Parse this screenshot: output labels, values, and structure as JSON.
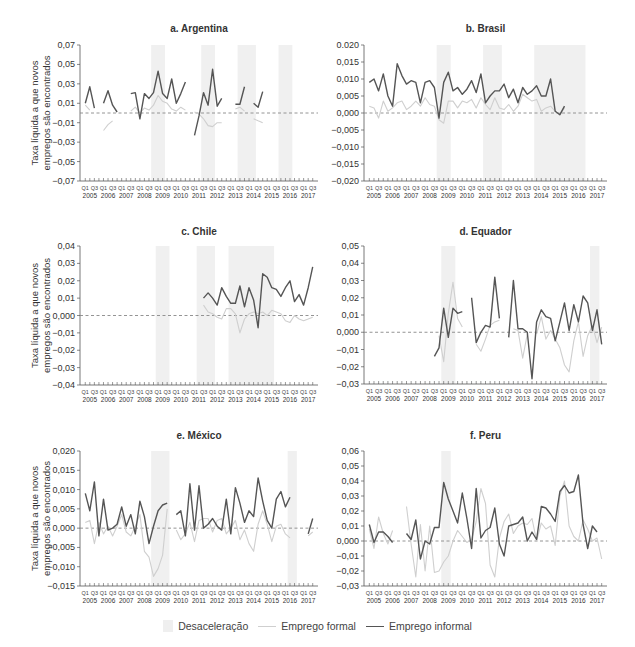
{
  "figure": {
    "legend": {
      "recession_label": "Desaceleração",
      "formal_label": "Emprego formal",
      "informal_label": "Emprego informal"
    },
    "ylabel_line1": "Taxa líquida a que novos",
    "ylabel_line2": "empregos são encontrados"
  },
  "colors": {
    "informal": "#555555",
    "formal": "#cfcfcf",
    "recession_band": "#f0f0f0",
    "zero_line": "#888888",
    "axis": "#555555"
  },
  "chart_data": [
    {
      "type": "line",
      "title": "a. Argentina",
      "xlabel": "",
      "ylabel": "Taxa líquida a que novos empregos são encontrados",
      "x_ticks_years": [
        "2005",
        "2006",
        "2007",
        "2008",
        "2009",
        "2010",
        "2011",
        "2012",
        "2013",
        "2014",
        "2015",
        "2016",
        "2017"
      ],
      "x_tick_quarters": [
        "Q1",
        "Q3"
      ],
      "yticks": [
        0.07,
        0.05,
        0.03,
        0.01,
        -0.01,
        -0.03,
        -0.05,
        -0.07
      ],
      "ytick_labels": [
        "0,07",
        "0,05",
        "0,03",
        "0,01",
        "−0,01",
        "−0,03",
        "−0,05",
        "−0,07"
      ],
      "ylim": [
        -0.07,
        0.07
      ],
      "recessions": [
        [
          15,
          17
        ],
        [
          26,
          28
        ],
        [
          34,
          37
        ],
        [
          43,
          45
        ]
      ],
      "series": [
        {
          "name": "Emprego informal",
          "values": [
            0.01,
            0.027,
            0.005,
            null,
            0.01,
            0.023,
            0.008,
            0.001,
            null,
            null,
            0.02,
            0.021,
            -0.006,
            0.02,
            0.015,
            0.021,
            0.043,
            0.02,
            0.015,
            0.035,
            0.01,
            0.02,
            0.032,
            null,
            -0.023,
            -0.003,
            0.021,
            0.008,
            0.045,
            0.007,
            0.015,
            null,
            null,
            0.009,
            0.009,
            0.027,
            null,
            0.01,
            0.006,
            0.022,
            null,
            null,
            null,
            null,
            null,
            null,
            null,
            null,
            null,
            null,
            null
          ]
        },
        {
          "name": "Emprego formal",
          "values": [
            0.008,
            0.003,
            null,
            null,
            -0.018,
            -0.012,
            -0.008,
            null,
            null,
            null,
            0.002,
            0.006,
            0.0,
            0.005,
            0.003,
            0.008,
            0.018,
            0.012,
            0.01,
            0.004,
            0.002,
            0.006,
            0.003,
            null,
            0.001,
            -0.001,
            -0.006,
            -0.013,
            -0.014,
            -0.01,
            -0.01,
            null,
            null,
            0.004,
            0.006,
            0.002,
            null,
            -0.006,
            -0.008,
            -0.01,
            null,
            null,
            null,
            null,
            null,
            null,
            null,
            null,
            null,
            null,
            null
          ]
        }
      ]
    },
    {
      "type": "line",
      "title": "b. Brasil",
      "x_ticks_years": [
        "2005",
        "2006",
        "2007",
        "2008",
        "2009",
        "2010",
        "2011",
        "2012",
        "2013",
        "2014",
        "2015",
        "2016",
        "2017"
      ],
      "x_tick_quarters": [
        "Q1",
        "Q3"
      ],
      "yticks": [
        0.02,
        0.015,
        0.01,
        0.005,
        0.0,
        -0.005,
        -0.01,
        -0.015,
        -0.02
      ],
      "ytick_labels": [
        "0.020",
        "0,015",
        "0,010",
        "0,005",
        "0,000",
        "−0,005",
        "−0,010",
        "−0,015",
        "−0,020"
      ],
      "ylim": [
        -0.02,
        0.02
      ],
      "recessions": [
        [
          15,
          17
        ],
        [
          25,
          28
        ],
        [
          36,
          46
        ]
      ],
      "series": [
        {
          "name": "Emprego informal",
          "values": [
            0.009,
            0.01,
            0.0065,
            0.0115,
            0.005,
            0.002,
            0.0145,
            0.011,
            0.0085,
            0.0095,
            0.009,
            0.003,
            0.009,
            0.0095,
            0.0075,
            -0.0015,
            0.009,
            0.012,
            0.0065,
            0.0075,
            0.0055,
            0.007,
            0.0095,
            0.006,
            0.0115,
            0.003,
            0.005,
            0.0065,
            0.0065,
            0.0085,
            0.0045,
            0.007,
            0.003,
            0.0075,
            0.0055,
            0.0065,
            0.008,
            0.005,
            0.005,
            0.01,
            0.0005,
            -0.0005,
            0.002,
            null,
            null,
            null,
            null,
            null,
            null,
            null,
            null
          ]
        },
        {
          "name": "Emprego formal",
          "values": [
            0.002,
            0.0015,
            -0.0015,
            0.0035,
            0.0005,
            0.0015,
            0.003,
            0.0035,
            0.001,
            0.002,
            0.0035,
            0.002,
            0.0045,
            0.0025,
            0.002,
            -0.002,
            -0.003,
            0.0035,
            0.0035,
            0.0015,
            0.0035,
            0.003,
            0.004,
            0.0015,
            0.0045,
            0.0025,
            0.001,
            0.0045,
            0.0015,
            0.001,
            0.0025,
            0.0005,
            0.002,
            0.0055,
            0.0045,
            0.0035,
            0.004,
            0.0005,
            0.0015,
            0.002,
            0.0005,
            -0.0005,
            0.0015,
            null,
            null,
            null,
            null,
            null,
            null,
            null,
            null
          ]
        }
      ]
    },
    {
      "type": "line",
      "title": "c. Chile",
      "x_ticks_years": [
        "2005",
        "2006",
        "2007",
        "2008",
        "2009",
        "2010",
        "2011",
        "2012",
        "2013",
        "2014",
        "2015",
        "2016",
        "2017"
      ],
      "x_tick_quarters": [
        "Q1",
        "Q3"
      ],
      "yticks": [
        0.04,
        0.03,
        0.02,
        0.01,
        0.0,
        -0.01,
        -0.02,
        -0.03,
        -0.04
      ],
      "ytick_labels": [
        "0,04",
        "0,03",
        "0,02",
        "0,01",
        "0,000",
        "−0,01",
        "−0,02",
        "−0,03",
        "−0,04"
      ],
      "ylim": [
        -0.04,
        0.04
      ],
      "recessions": [
        [
          16,
          18
        ],
        [
          25,
          28
        ],
        [
          32,
          41
        ]
      ],
      "series": [
        {
          "name": "Emprego informal",
          "values": [
            null,
            null,
            null,
            null,
            null,
            null,
            null,
            null,
            null,
            null,
            null,
            null,
            null,
            null,
            null,
            null,
            null,
            null,
            null,
            null,
            null,
            null,
            null,
            null,
            null,
            null,
            0.01,
            0.013,
            0.01,
            0.006,
            0.016,
            0.011,
            0.007,
            0.007,
            0.017,
            0.005,
            0.016,
            0.009,
            -0.007,
            0.024,
            0.022,
            0.016,
            0.015,
            0.011,
            0.016,
            0.02,
            0.008,
            0.012,
            0.006,
            0.016,
            0.028
          ]
        },
        {
          "name": "Emprego formal",
          "values": [
            null,
            null,
            null,
            null,
            null,
            null,
            null,
            null,
            null,
            null,
            null,
            null,
            null,
            null,
            null,
            null,
            null,
            null,
            null,
            null,
            null,
            null,
            null,
            null,
            null,
            null,
            0.006,
            0.002,
            0.001,
            -0.001,
            -0.002,
            0.004,
            0.004,
            0.001,
            -0.01,
            -0.002,
            0.001,
            0.002,
            0.001,
            0.002,
            0.0,
            0.003,
            0.002,
            0.001,
            -0.003,
            -0.004,
            0.0,
            -0.002,
            -0.003,
            -0.002,
            -0.001
          ]
        }
      ]
    },
    {
      "type": "line",
      "title": "d. Equador",
      "x_ticks_years": [
        "2005",
        "2006",
        "2007",
        "2008",
        "2009",
        "2010",
        "2011",
        "2012",
        "2013",
        "2014",
        "2015",
        "2016",
        "2017"
      ],
      "x_tick_quarters": [
        "Q1",
        "Q3"
      ],
      "yticks": [
        0.05,
        0.04,
        0.03,
        0.02,
        0.01,
        0.0,
        -0.01,
        -0.02,
        -0.03
      ],
      "ytick_labels": [
        "0,05",
        "0,04",
        "0,03",
        "0,02",
        "0,01",
        "0,000",
        "−0,01",
        "−0,02",
        "−0,03"
      ],
      "ylim": [
        -0.03,
        0.05
      ],
      "recessions": [
        [
          16,
          18
        ],
        [
          48,
          49
        ]
      ],
      "series": [
        {
          "name": "Emprego informal",
          "values": [
            null,
            null,
            null,
            null,
            null,
            null,
            null,
            null,
            null,
            null,
            null,
            null,
            null,
            null,
            -0.014,
            -0.009,
            0.014,
            -0.003,
            0.014,
            0.011,
            0.012,
            null,
            0.02,
            -0.006,
            0.0,
            0.004,
            0.003,
            0.032,
            0.008,
            null,
            -0.003,
            0.03,
            0.002,
            0.002,
            0.0,
            -0.027,
            0.006,
            0.013,
            0.009,
            0.008,
            -0.005,
            0.006,
            0.017,
            0.001,
            0.016,
            0.006,
            0.021,
            0.017,
            0.001,
            0.013,
            -0.007
          ]
        },
        {
          "name": "Emprego formal",
          "values": [
            null,
            null,
            null,
            null,
            null,
            null,
            null,
            null,
            null,
            null,
            null,
            null,
            null,
            null,
            null,
            -0.002,
            -0.017,
            0.011,
            0.029,
            0.008,
            0.003,
            null,
            null,
            -0.007,
            -0.011,
            -0.004,
            0.004,
            0.006,
            0.007,
            null,
            null,
            0.002,
            0.001,
            -0.015,
            -0.001,
            null,
            -0.001,
            0.009,
            -0.004,
            0.001,
            -0.004,
            -0.009,
            -0.019,
            -0.023,
            -0.005,
            0.006,
            -0.014,
            -0.002,
            0.004,
            -0.006,
            0.003
          ]
        }
      ]
    },
    {
      "type": "line",
      "title": "e. México",
      "x_ticks_years": [
        "2005",
        "2006",
        "2007",
        "2008",
        "2009",
        "2010",
        "2011",
        "2012",
        "2013",
        "2014",
        "2015",
        "2016",
        "2017"
      ],
      "x_tick_quarters": [
        "Q1",
        "Q3"
      ],
      "yticks": [
        0.02,
        0.015,
        0.01,
        0.005,
        0.0,
        -0.005,
        -0.01,
        -0.015
      ],
      "ytick_labels": [
        "0,020",
        "0,015",
        "0,010",
        "0,005",
        "0,000",
        "−0,005",
        "−0,010",
        "−0,015"
      ],
      "ylim": [
        -0.015,
        0.02
      ],
      "recessions": [
        [
          15,
          18
        ],
        [
          45,
          46
        ]
      ],
      "series": [
        {
          "name": "Emprego informal",
          "values": [
            0.009,
            0.0045,
            0.012,
            -0.002,
            0.0075,
            -0.0005,
            0.0,
            0.001,
            0.0055,
            0.0005,
            0.0035,
            -0.0015,
            0.007,
            0.003,
            -0.004,
            0.0005,
            0.0045,
            0.006,
            0.0065,
            null,
            0.0035,
            0.0045,
            -0.002,
            0.0115,
            -0.0005,
            0.011,
            0.0,
            0.001,
            0.0025,
            0.0005,
            -0.0005,
            0.0075,
            -0.0015,
            0.0105,
            0.0065,
            0.0015,
            0.0045,
            0.003,
            0.013,
            0.007,
            0.002,
            0.0,
            0.0075,
            0.0095,
            0.0055,
            0.008,
            null,
            null,
            null,
            -0.0015,
            0.0025
          ]
        },
        {
          "name": "Emprego formal",
          "values": [
            0.0015,
            0.002,
            -0.004,
            0.0015,
            -0.0015,
            0.0005,
            -0.002,
            0.0005,
            0.0035,
            -0.001,
            -0.002,
            0.0005,
            0.0035,
            -0.006,
            -0.0075,
            -0.0125,
            -0.0105,
            -0.007,
            0.005,
            null,
            -0.0005,
            -0.003,
            -0.0015,
            0.0015,
            -0.0035,
            0.002,
            0.0025,
            0.0025,
            -0.001,
            0.002,
            0.0025,
            -0.0015,
            0.0,
            0.002,
            -0.003,
            -0.0005,
            -0.004,
            -0.006,
            0.001,
            0.0045,
            0.001,
            -0.0035,
            0.0005,
            0.001,
            -0.0015,
            -0.0025,
            null,
            null,
            null,
            -0.002,
            -0.001
          ]
        }
      ]
    },
    {
      "type": "line",
      "title": "f. Peru",
      "x_ticks_years": [
        "2005",
        "2006",
        "2007",
        "2008",
        "2009",
        "2010",
        "2011",
        "2012",
        "2013",
        "2014",
        "2015",
        "2016",
        "2017"
      ],
      "x_tick_quarters": [
        "Q1",
        "Q3"
      ],
      "yticks": [
        0.06,
        0.05,
        0.04,
        0.03,
        0.02,
        0.01,
        0.0,
        -0.01,
        -0.02,
        -0.03
      ],
      "ytick_labels": [
        "0,06",
        "0,05",
        "0,04",
        "0,03",
        "0,02",
        "0,01",
        "0,000",
        "−0,01",
        "−0,02",
        "−0,03"
      ],
      "ylim": [
        -0.03,
        0.06
      ],
      "recessions": [
        [
          16,
          17
        ]
      ],
      "series": [
        {
          "name": "Emprego informal",
          "values": [
            0.011,
            -0.001,
            0.006,
            0.006,
            0.003,
            -0.001,
            null,
            null,
            0.005,
            0.001,
            0.014,
            -0.012,
            0.0,
            -0.002,
            0.009,
            0.009,
            0.039,
            0.028,
            0.02,
            0.012,
            0.032,
            0.015,
            -0.005,
            0.035,
            0.002,
            0.007,
            0.009,
            0.022,
            -0.002,
            -0.01,
            0.01,
            0.011,
            0.012,
            0.016,
            0.0,
            0.006,
            0.001,
            0.023,
            0.022,
            0.018,
            0.013,
            0.033,
            0.037,
            0.032,
            0.033,
            0.044,
            0.011,
            -0.005,
            0.01,
            0.006,
            null
          ]
        },
        {
          "name": "Emprego formal",
          "values": [
            0.008,
            -0.005,
            0.016,
            0.005,
            -0.002,
            0.007,
            null,
            null,
            0.023,
            -0.002,
            -0.024,
            0.011,
            -0.02,
            0.01,
            -0.021,
            -0.02,
            -0.014,
            -0.01,
            0.0,
            0.007,
            0.003,
            -0.001,
            0.001,
            0.013,
            0.035,
            0.025,
            -0.016,
            -0.024,
            0.002,
            0.013,
            0.018,
            0.005,
            0.01,
            0.012,
            0.011,
            0.015,
            0.0,
            0.012,
            0.008,
            0.01,
            -0.003,
            0.03,
            0.04,
            0.01,
            0.003,
            0.0,
            0.014,
            0.008,
            0.0,
            0.002,
            -0.012
          ]
        }
      ]
    }
  ]
}
